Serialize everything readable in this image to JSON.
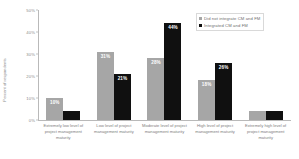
{
  "chart_data": {
    "type": "bar",
    "title": "",
    "xlabel": "",
    "ylabel": "Percent of respondents",
    "ylim": [
      0,
      50
    ],
    "grid": false,
    "legend_position": "top-right",
    "categories": [
      "Extremely low level of project management maturity",
      "Low level of project management maturity",
      "Moderate level of project management maturity",
      "High level of project management maturity",
      "Extremely high level of project management maturity"
    ],
    "ytick_labels": [
      "50%",
      "40%",
      "30%",
      "20%",
      "10%",
      "0%"
    ],
    "ytick_values": [
      50,
      40,
      30,
      20,
      10,
      0
    ],
    "series": [
      {
        "name": "Did not integrate CM and FM",
        "color": "#a6a6a6",
        "values": [
          10,
          31,
          28,
          18,
          4
        ],
        "labels": [
          "10%",
          "31%",
          "28%",
          "18%",
          "4%"
        ]
      },
      {
        "name": "Integrated CM and FM",
        "color": "#101010",
        "values": [
          4,
          21,
          44,
          26,
          4
        ],
        "labels": [
          "4%",
          "21%",
          "44%",
          "26%",
          "4%"
        ]
      }
    ]
  },
  "legend": {
    "items": [
      {
        "label": "Did not integrate CM and FM",
        "swatch": "legend-swatch-gray"
      },
      {
        "label": "Integrated CM and FM",
        "swatch": "legend-swatch-black"
      }
    ]
  }
}
